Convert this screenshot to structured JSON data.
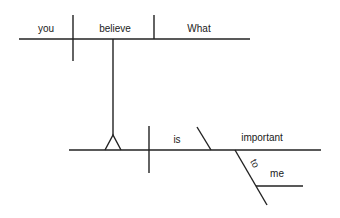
{
  "diagram": {
    "type": "sentence-diagram",
    "sentence": "What you believe is important to me",
    "line_color": "#222222",
    "text_color": "#1a1a1a",
    "clause": {
      "subject": "you",
      "verb": "believe",
      "object": "What"
    },
    "main": {
      "linking_verb": "is",
      "predicate_adjective": "important",
      "preposition": "to",
      "prep_object": "me"
    }
  }
}
